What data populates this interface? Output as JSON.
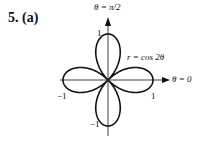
{
  "problem": {
    "number": "5.",
    "part": "(a)"
  },
  "axes": {
    "top_label": "θ = π/2",
    "right_label": "θ = 0"
  },
  "curve_label": "r = cos 2θ",
  "ticks": {
    "top": "1",
    "bottom": "−1",
    "left": "−1",
    "right": "1"
  },
  "chart_data": {
    "type": "line",
    "title": "",
    "equation": "r = cos 2θ",
    "coordinate_system": "polar",
    "theta_range": [
      0,
      6.2832
    ],
    "petals": 4,
    "max_r": 1,
    "annotations": [
      "θ = π/2",
      "θ = 0",
      "r = cos 2θ"
    ],
    "tick_labels": {
      "x": [
        "−1",
        "1"
      ],
      "y": [
        "1",
        "−1"
      ]
    },
    "xlim": [
      -1,
      1
    ],
    "ylim": [
      -1,
      1
    ]
  }
}
